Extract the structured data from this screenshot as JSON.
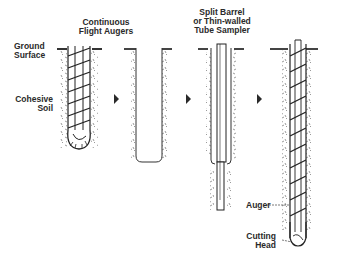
{
  "diagram": {
    "labels": {
      "augers": "Continuous\nFlight Augers",
      "ground": "Ground\nSurface",
      "soil": "Cohesive\nSoil",
      "sampler": "Split Barrel\nor Thin-walled\nTube Sampler",
      "auger": "Auger",
      "cutting_head": "Cutting\nHead"
    },
    "steps": [
      {
        "id": 1,
        "content": "Auger drilled into soil"
      },
      {
        "id": 2,
        "content": "Open borehole"
      },
      {
        "id": 3,
        "content": "Sampler inserted"
      },
      {
        "id": 4,
        "content": "Auger advanced with cutting head"
      }
    ],
    "colors": {
      "ink": "#2a2a2a",
      "background": "#ffffff"
    }
  }
}
